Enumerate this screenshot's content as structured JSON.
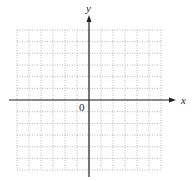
{
  "diagram": {
    "type": "coordinate-grid",
    "grid": {
      "columns": 12,
      "rows": 12,
      "left": 17,
      "top": 30,
      "cell_width": 12,
      "cell_height": 11.67,
      "line_color": "#b8b8b8",
      "line_style": "dotted"
    },
    "axes": {
      "color": "#222222",
      "x_axis": {
        "label": "x",
        "y": 100,
        "x_start": 9,
        "x_end": 176
      },
      "y_axis": {
        "label": "y",
        "x": 89,
        "y_start": 15,
        "y_end": 177
      },
      "origin_label": "0"
    }
  }
}
